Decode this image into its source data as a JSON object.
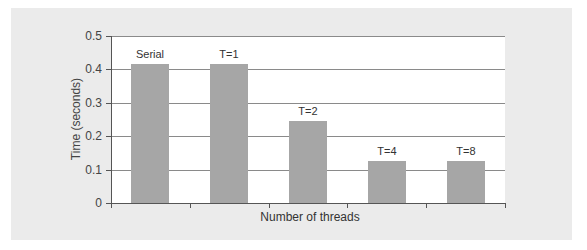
{
  "chart_data": {
    "type": "bar",
    "title": "",
    "xlabel": "Number of threads",
    "ylabel": "Time (seconds)",
    "categories": [
      "Serial",
      "T=1",
      "T=2",
      "T=4",
      "T=8"
    ],
    "values": [
      0.415,
      0.415,
      0.245,
      0.125,
      0.125
    ],
    "ylim": [
      0,
      0.5
    ],
    "yticks": [
      "0",
      "0.1",
      "0.2",
      "0.3",
      "0.4",
      "0.5"
    ],
    "grid": true,
    "legend": null,
    "bar_color": "#a6a6a6",
    "background_color": "#ebebeb"
  }
}
